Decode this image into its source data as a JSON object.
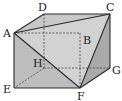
{
  "diagram": {
    "type": "geometry-solid",
    "colors": {
      "stroke": "#2a2a2a",
      "face_light": "#cfcfcf",
      "face_mid": "#b9b9b9",
      "face_dark": "#a8a8a8",
      "background": "#ffffff"
    },
    "vertices": {
      "A": {
        "label": "A",
        "x": 14,
        "y": 33
      },
      "B": {
        "label": "B",
        "x": 80,
        "y": 33
      },
      "C": {
        "label": "C",
        "x": 110,
        "y": 14
      },
      "D": {
        "label": "D",
        "x": 44,
        "y": 14
      },
      "E": {
        "label": "E",
        "x": 14,
        "y": 88
      },
      "F": {
        "label": "F",
        "x": 80,
        "y": 88
      },
      "G": {
        "label": "G",
        "x": 110,
        "y": 68
      },
      "H": {
        "label": "H",
        "x": 44,
        "y": 68
      }
    },
    "solid_edges": [
      [
        "A",
        "D"
      ],
      [
        "D",
        "C"
      ],
      [
        "A",
        "C"
      ],
      [
        "A",
        "E"
      ],
      [
        "E",
        "F"
      ],
      [
        "A",
        "F"
      ],
      [
        "C",
        "F"
      ],
      [
        "C",
        "G"
      ],
      [
        "G",
        "F"
      ]
    ],
    "dashed_edges": [
      [
        "A",
        "B"
      ],
      [
        "B",
        "F"
      ],
      [
        "D",
        "H"
      ],
      [
        "H",
        "G"
      ],
      [
        "H",
        "E"
      ]
    ]
  }
}
